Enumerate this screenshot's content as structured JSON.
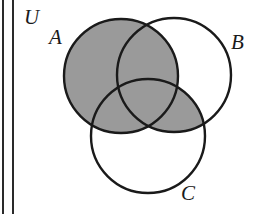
{
  "diagram": {
    "type": "venn",
    "universe_label": "U",
    "sets": [
      {
        "id": "A",
        "label": "A",
        "cx": 121,
        "cy": 76,
        "r": 57
      },
      {
        "id": "B",
        "label": "B",
        "cx": 174,
        "cy": 75,
        "r": 57
      },
      {
        "id": "C",
        "label": "C",
        "cx": 148,
        "cy": 136,
        "r": 57
      }
    ],
    "shaded_region": "A ∪ (B ∩ C)",
    "colors": {
      "shade": "#9a9a9a",
      "stroke": "#1a1a1a",
      "background": "#ffffff"
    }
  }
}
